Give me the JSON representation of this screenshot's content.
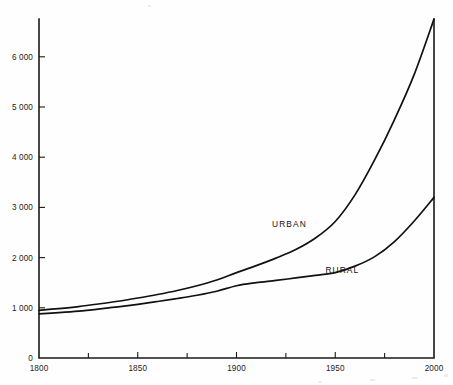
{
  "chart_data": {
    "type": "line",
    "title": "",
    "subtitle": "",
    "xlabel": "",
    "ylabel": "",
    "xlim": [
      1800,
      2000
    ],
    "ylim": [
      0,
      6750
    ],
    "grid": false,
    "legend_position": "inline-annotation",
    "x_ticks": [
      {
        "value": 1800,
        "label": "1800",
        "major": true
      },
      {
        "value": 1825,
        "label": "",
        "major": false
      },
      {
        "value": 1850,
        "label": "1850",
        "major": true
      },
      {
        "value": 1875,
        "label": "",
        "major": false
      },
      {
        "value": 1900,
        "label": "1900",
        "major": true
      },
      {
        "value": 1925,
        "label": "",
        "major": false
      },
      {
        "value": 1950,
        "label": "1950",
        "major": true
      },
      {
        "value": 1975,
        "label": "",
        "major": false
      },
      {
        "value": 2000,
        "label": "2000",
        "major": true
      }
    ],
    "y_ticks": [
      {
        "value": 0,
        "label": "0"
      },
      {
        "value": 1000,
        "label": "1 000"
      },
      {
        "value": 2000,
        "label": "2 000"
      },
      {
        "value": 3000,
        "label": "3 000"
      },
      {
        "value": 4000,
        "label": "4 000"
      },
      {
        "value": 5000,
        "label": "5 000"
      },
      {
        "value": 6000,
        "label": "6 000"
      }
    ],
    "x": [
      1800,
      1810,
      1820,
      1830,
      1840,
      1850,
      1860,
      1870,
      1880,
      1890,
      1900,
      1910,
      1920,
      1930,
      1940,
      1950,
      1960,
      1970,
      1980,
      1990,
      2000
    ],
    "series": [
      {
        "name": "URBAN",
        "label": "URBAN",
        "color": "#111111",
        "values": [
          950,
          985,
          1025,
          1075,
          1130,
          1195,
          1265,
          1345,
          1440,
          1555,
          1700,
          1840,
          1990,
          2160,
          2390,
          2720,
          3250,
          3950,
          4750,
          5650,
          6750
        ]
      },
      {
        "name": "RURAL",
        "label": "RURAL",
        "color": "#111111",
        "values": [
          880,
          905,
          935,
          975,
          1020,
          1070,
          1125,
          1185,
          1250,
          1330,
          1440,
          1500,
          1545,
          1595,
          1645,
          1700,
          1830,
          2020,
          2320,
          2730,
          3200
        ]
      }
    ],
    "annotations": [
      {
        "text": "URBAN",
        "x": 1918,
        "y": 2610,
        "name": "urban-series-label"
      },
      {
        "text": "RURAL",
        "x": 1945,
        "y": 1700,
        "name": "rural-series-label"
      }
    ],
    "colors": {
      "line": "#111111",
      "axis": "#1a1a1a",
      "text": "#1c1c1c",
      "background": "#ffffff"
    }
  }
}
